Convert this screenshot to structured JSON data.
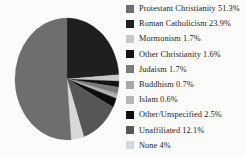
{
  "chart_data": {
    "type": "pie",
    "title": "",
    "subtitle": "",
    "legend_position": "right",
    "grid": false,
    "start_angle_deg": 0,
    "direction": "clockwise",
    "units": "percent",
    "categories": [
      "Protestant Christianity",
      "Roman Catholicism",
      "Mormonism",
      "Other Christianity",
      "Judaism",
      "Buddhism",
      "Islam",
      "Other/Unspecified",
      "Unaffiliated",
      "None"
    ],
    "values": [
      51.3,
      23.9,
      1.7,
      1.6,
      1.7,
      0.7,
      0.6,
      2.5,
      12.1,
      4
    ],
    "slice_colors": [
      "#6e6e6e",
      "#1f1f1f",
      "#c9c9c9",
      "#141414",
      "#7a7a7a",
      "#a8a8a8",
      "#b5b5b5",
      "#0d0d0d",
      "#565656",
      "#d8d8d8"
    ],
    "slice_order_clockwise_from_top": [
      "Roman Catholicism",
      "Mormonism",
      "Other Christianity",
      "Judaism",
      "Buddhism",
      "Islam",
      "Other/Unspecified",
      "Unaffiliated",
      "None",
      "Protestant Christianity"
    ]
  },
  "legend": {
    "items": [
      {
        "label": "Protestant Christianity 51.3%",
        "color": "#6e6e6e",
        "name": "protestant-christianity"
      },
      {
        "label": "Roman Catholicism 23.9%",
        "color": "#1f1f1f",
        "name": "roman-catholicism"
      },
      {
        "label": "Mormonism 1.7%",
        "color": "#c9c9c9",
        "name": "mormonism"
      },
      {
        "label": "Other Christianity 1.6%",
        "color": "#141414",
        "name": "other-christianity"
      },
      {
        "label": "Judaism 1.7%",
        "color": "#7a7a7a",
        "name": "judaism"
      },
      {
        "label": "Buddhism 0.7%",
        "color": "#a8a8a8",
        "name": "buddhism"
      },
      {
        "label": "Islam 0.6%",
        "color": "#b5b5b5",
        "name": "islam"
      },
      {
        "label": "Other/Unspecified 2.5%",
        "color": "#0d0d0d",
        "name": "other-unspecified"
      },
      {
        "label": "Unaffiliated 12.1%",
        "color": "#565656",
        "name": "unaffiliated"
      },
      {
        "label": "None 4%",
        "color": "#d8d8d8",
        "name": "none"
      }
    ]
  },
  "colors": {
    "background": "#fbfbfa",
    "text": "#1b1b1b"
  }
}
